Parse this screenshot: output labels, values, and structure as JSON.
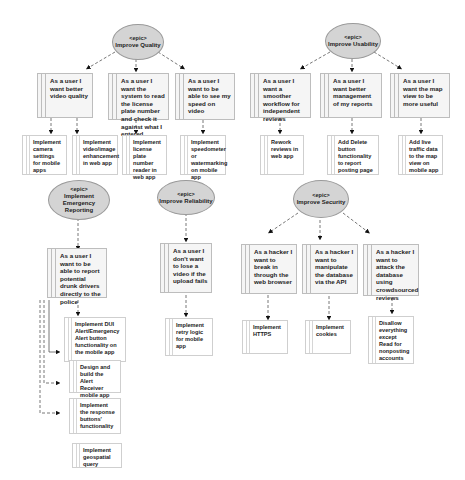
{
  "epics": [
    {
      "tag": "<epic>",
      "title": "Improve Quality"
    },
    {
      "tag": "<epic>",
      "title": "Improve Usability"
    },
    {
      "tag": "<epic>",
      "title": "Implement Emergency Reporting"
    },
    {
      "tag": "<epic>",
      "title": "Improve Reliability"
    },
    {
      "tag": "<epic>",
      "title": "Improve Security"
    }
  ],
  "stories": [
    "As a user I want better video quality",
    "As a user I want the system to read the license plate number and check it against what I entered",
    "As a user I want to be able to see my speed on video",
    "As a user I want a smoother workflow for independent reviews",
    "As a user I want better management of my reports",
    "As a user I want the map view to be more useful",
    "As a user I want to be able to report potential drunk drivers directly to the police",
    "As a user I don't want to lose a video if the upload fails",
    "As a hacker I want to break in through the web browser",
    "As a hacker I want to manipulate the database via the API",
    "As a hacker I want to attack the database using crowdsourced reviews"
  ],
  "tasks": [
    "Implement camera settings for mobile apps",
    "Implement video/image enhancement in web app",
    "Implement license plate number reader in web app",
    "Implement speedometer or watermarking on mobile app",
    "Rework reviews in web app",
    "Add Delete button functionality to report posting page",
    "Add live traffic data to the map view on mobile app",
    "Implement DUI Alert/Emergency Alert button functionality on the mobile app",
    "Design and build the Alert Receiver mobile app",
    "Implement the response buttons' functionality",
    "Implement geospatial query",
    "Implement retry logic for mobile app",
    "Implement HTTPS",
    "Implement cookies",
    "Disallow everything except Read for nonposting accounts"
  ]
}
